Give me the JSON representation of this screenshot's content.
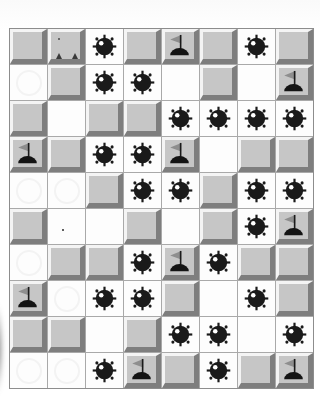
{
  "board": {
    "rows": 10,
    "cols": 8,
    "cell_legend": {
      "U": "covered-tile",
      "UX": "covered-tile-with-stray-marks",
      "E": "revealed-empty-cell",
      "ED": "revealed-empty-cell-with-speck",
      "G": "revealed-empty-cell-with-faint-ghost",
      "M": "revealed-mine",
      "F": "flagged-tile"
    },
    "cells": [
      [
        "U",
        "UX",
        "M",
        "U",
        "F",
        "U",
        "M",
        "U"
      ],
      [
        "G",
        "U",
        "M",
        "M",
        "E",
        "U",
        "E",
        "F"
      ],
      [
        "U",
        "E",
        "U",
        "U",
        "M",
        "M",
        "M",
        "M"
      ],
      [
        "F",
        "U",
        "M",
        "M",
        "F",
        "E",
        "U",
        "U"
      ],
      [
        "G",
        "G",
        "U",
        "M",
        "M",
        "U",
        "M",
        "M"
      ],
      [
        "U",
        "ED",
        "E",
        "U",
        "E",
        "U",
        "M",
        "F"
      ],
      [
        "G",
        "U",
        "U",
        "M",
        "F",
        "M",
        "U",
        "U"
      ],
      [
        "F",
        "G",
        "M",
        "M",
        "U",
        "E",
        "M",
        "U"
      ],
      [
        "U",
        "U",
        "E",
        "U",
        "M",
        "M",
        "E",
        "M"
      ],
      [
        "G",
        "G",
        "M",
        "F",
        "U",
        "M",
        "U",
        "F"
      ]
    ],
    "visible_mine_count": 25,
    "visible_flag_count": 9
  },
  "icons": {
    "mine": "mine-icon",
    "flag": "flag-icon"
  },
  "colors": {
    "tile_face": "#c6c6c6",
    "tile_highlight": "#f4f4f4",
    "tile_shadow": "#7e7e7e",
    "revealed_bg": "#fdfdfd",
    "grid_line": "#a9a9a9",
    "board_border": "#8d8d8d",
    "ghost": "#f3f3f3",
    "mine_body": "#1a1a1a",
    "mine_glint": "#ffffff",
    "flag_pennant": "#8e8e8e",
    "flag_pole": "#1b1b1b",
    "flag_base": "#141414",
    "page_bg": "#ffffff"
  }
}
